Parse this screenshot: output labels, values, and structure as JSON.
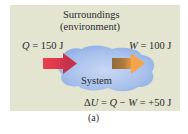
{
  "diagram": {
    "surroundings_label": "Surroundings",
    "surroundings_sublabel": "(environment)",
    "heat_label": {
      "var": "Q",
      "text": " = 150 J"
    },
    "work_label": {
      "var": "W",
      "text": " = 100 J"
    },
    "system_label": "System",
    "equation": {
      "delta": "Δ",
      "U": "U",
      "rest1": " = ",
      "Q": "Q",
      "minus": " − ",
      "W": "W",
      "rest2": " = +50 J"
    },
    "caption": "(a)"
  },
  "colors": {
    "panel_bg": "#e3e5d1",
    "cloud_fill": "#a9c2ec",
    "heat_arrow": "#e23a4a",
    "work_arrow_body": "#9a6b3c",
    "work_arrow_head": "#f2a046"
  }
}
